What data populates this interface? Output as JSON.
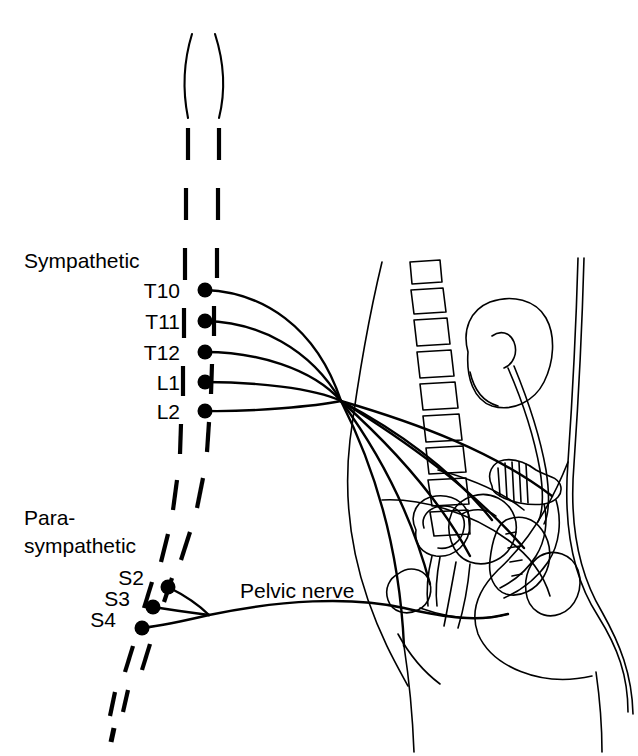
{
  "figure": {
    "background_color": "#ffffff",
    "ink_color": "#000000",
    "width": 638,
    "height": 756
  },
  "labels": {
    "sympathetic": "Sympathetic",
    "parasympathetic_line1": "Para-",
    "parasympathetic_line2": "sympathetic",
    "pelvic_nerve": "Pelvic nerve"
  },
  "spinal_segments": {
    "sympathetic": [
      {
        "id": "T10",
        "label": "T10",
        "dot_x": 205,
        "dot_y": 290
      },
      {
        "id": "T11",
        "label": "T11",
        "dot_x": 205,
        "dot_y": 321
      },
      {
        "id": "T12",
        "label": "T12",
        "dot_x": 205,
        "dot_y": 352
      },
      {
        "id": "L1",
        "label": "L1",
        "dot_x": 205,
        "dot_y": 382
      },
      {
        "id": "L2",
        "label": "L2",
        "dot_x": 205,
        "dot_y": 411
      }
    ],
    "parasympathetic": [
      {
        "id": "S2",
        "label": "S2",
        "dot_x": 168,
        "dot_y": 587
      },
      {
        "id": "S3",
        "label": "S3",
        "dot_x": 153,
        "dot_y": 607
      },
      {
        "id": "S4",
        "label": "S4",
        "dot_x": 142,
        "dot_y": 628
      }
    ]
  },
  "anatomy": {
    "spinal_cord": "dashed-double-line",
    "vertebrae_count": 9,
    "organs": [
      "kidney",
      "ureter",
      "bladder",
      "uterus",
      "rectum",
      "sacrum",
      "pubic-bone",
      "vagina",
      "urethra"
    ]
  },
  "nerve_paths": {
    "sympathetic_convergence": {
      "x": 341,
      "y": 401
    },
    "parasympathetic_convergence": {
      "x": 209,
      "y": 615
    }
  }
}
